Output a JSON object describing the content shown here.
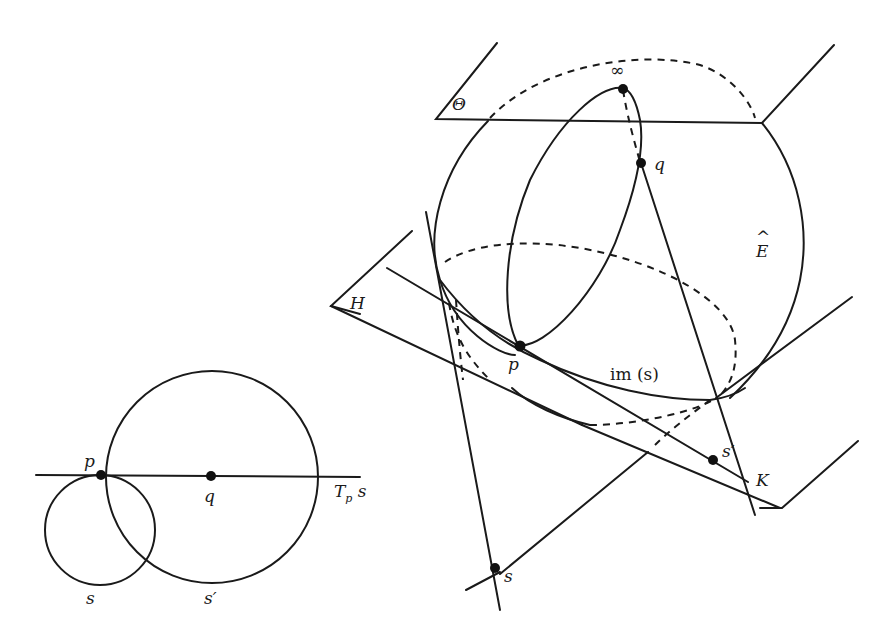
{
  "figure": {
    "left_diagram": {
      "description": "Two circles s and s' meeting at p; s' centered at q on the tangent line T_p s",
      "labels": {
        "p": "p",
        "q": "q",
        "tangent_main": "T",
        "tangent_sub": "p",
        "tangent_tail": " s",
        "circle_s": "s",
        "circle_s_prime": "s′"
      },
      "points": [
        "p",
        "q"
      ]
    },
    "right_diagram": {
      "description": "Riemann sphere Ê with planes Θ (top) and H (tangent), stereographic image im(s) of circle s",
      "labels": {
        "theta": "Θ",
        "infinity": "∞",
        "q": "q",
        "sphere": "E",
        "sphere_hat": "^",
        "plane_h": "H",
        "p": "p",
        "im_s": "im (s)",
        "s_prime": "s′",
        "k": "K",
        "s": "s"
      },
      "points": [
        "∞",
        "q",
        "p",
        "s′",
        "s"
      ]
    }
  },
  "colors": {
    "ink": "#1a1a1a",
    "background": "#ffffff"
  }
}
